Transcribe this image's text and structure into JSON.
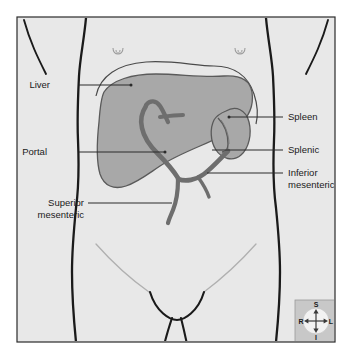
{
  "figure": {
    "type": "anatomical-illustration",
    "view": "anterior abdominal view",
    "canvas": {
      "width": 352,
      "height": 357
    }
  },
  "colors": {
    "background": "#ffffff",
    "panel_background": "#e8e8e8",
    "panel_border": "#2b2b2b",
    "body_outline": "#1a1a1a",
    "organ_fill": "#a8a8a8",
    "organ_stroke": "#5a5a5a",
    "vessel": "#6e6e6e",
    "leader_line": "#2b2b2b",
    "label_text": "#1a1a1a",
    "faint_line": "#b0b0b0",
    "compass_background": "#c8c8c8",
    "compass_disc": "#f2f2f2"
  },
  "labels": [
    {
      "id": "liver",
      "text": "Liver",
      "lines": [
        "Liver"
      ],
      "side": "left",
      "text_x": 50,
      "text_y": 88,
      "leader_from_x": 79,
      "leader_from_y": 85,
      "leader_to_x": 131,
      "leader_to_y": 85
    },
    {
      "id": "portal",
      "text": "Portal",
      "lines": [
        "Portal"
      ],
      "side": "left",
      "text_x": 47,
      "text_y": 155,
      "leader_from_x": 79,
      "leader_from_y": 152,
      "leader_to_x": 165,
      "leader_to_y": 152
    },
    {
      "id": "superior-mesenteric",
      "text": "Superior mesenteric",
      "lines": [
        "Superior",
        "mesenteric"
      ],
      "side": "left",
      "text_x": 36,
      "text_y": 206,
      "leader_from_x": 88,
      "leader_from_y": 203,
      "leader_to_x": 172,
      "leader_to_y": 203
    },
    {
      "id": "spleen",
      "text": "Spleen",
      "lines": [
        "Spleen"
      ],
      "side": "right",
      "text_x": 288,
      "text_y": 120,
      "leader_from_x": 283,
      "leader_from_y": 117,
      "leader_to_x": 229,
      "leader_to_y": 117
    },
    {
      "id": "splenic",
      "text": "Splenic",
      "lines": [
        "Splenic"
      ],
      "side": "right",
      "text_x": 288,
      "text_y": 153,
      "leader_from_x": 283,
      "leader_from_y": 150,
      "leader_to_x": 212,
      "leader_to_y": 150
    },
    {
      "id": "inferior-mesenteric",
      "text": "Inferior mesenteric",
      "lines": [
        "Inferior",
        "mesenteric"
      ],
      "side": "right",
      "text_x": 288,
      "text_y": 176,
      "leader_from_x": 283,
      "leader_from_y": 173,
      "leader_to_x": 207,
      "leader_to_y": 173
    }
  ],
  "organs": [
    {
      "id": "liver",
      "name": "Liver",
      "fill": "#a8a8a8"
    },
    {
      "id": "spleen",
      "name": "Spleen",
      "fill": "#a8a8a8"
    }
  ],
  "vessels": [
    {
      "id": "portal-vein",
      "name": "Portal vein"
    },
    {
      "id": "splenic-vein",
      "name": "Splenic vein"
    },
    {
      "id": "superior-mesenteric-vein",
      "name": "Superior mesenteric vein"
    },
    {
      "id": "inferior-mesenteric-vein",
      "name": "Inferior mesenteric vein"
    }
  ],
  "compass": {
    "name": "orientation-compass",
    "superior": "S",
    "inferior": "I",
    "right": "R",
    "left": "L",
    "box": {
      "x": 295,
      "y": 300,
      "width": 42,
      "height": 42
    }
  }
}
